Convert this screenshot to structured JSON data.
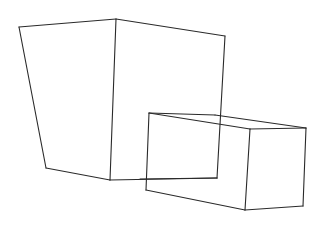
{
  "drawing": {
    "description": "Pencil line sketch of two boxes in perspective",
    "stroke_color": "#2a2a2a",
    "background": "#ffffff",
    "large_box": {
      "segments": [
        [
          19,
          27,
          116,
          19
        ],
        [
          116,
          19,
          225,
          36
        ],
        [
          19,
          27,
          46,
          168
        ],
        [
          116,
          19,
          110,
          180
        ],
        [
          225,
          36,
          217,
          178
        ],
        [
          46,
          168,
          110,
          180
        ],
        [
          110,
          180,
          217,
          178
        ]
      ]
    },
    "small_box": {
      "segments": [
        [
          149,
          113,
          215,
          115
        ],
        [
          215,
          115,
          306,
          128
        ],
        [
          149,
          113,
          250,
          129
        ],
        [
          250,
          129,
          306,
          128
        ],
        [
          149,
          113,
          146,
          190
        ],
        [
          250,
          129,
          245,
          210
        ],
        [
          306,
          128,
          303,
          206
        ],
        [
          146,
          190,
          245,
          210
        ],
        [
          245,
          210,
          303,
          206
        ],
        [
          140,
          179,
          217,
          178
        ]
      ]
    }
  }
}
